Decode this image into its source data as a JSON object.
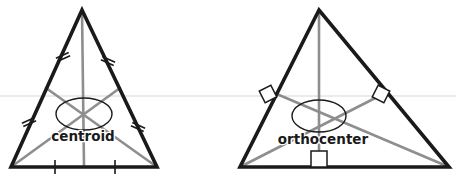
{
  "figure": {
    "background_color": "#ffffff",
    "width": 456,
    "height": 184,
    "artifact_line": {
      "name": "scan-artifact-line",
      "color": "#eceaea",
      "y": 96,
      "x1": 0,
      "x2": 456,
      "thickness": 2
    }
  },
  "styles": {
    "triangle_stroke": "#1a1a1a",
    "triangle_stroke_width": 3.6,
    "cevian_stroke": "#8e8e8e",
    "cevian_stroke_width": 2.6,
    "tick_stroke": "#1a1a1a",
    "tick_stroke_width": 1.6,
    "marker_square_stroke": "#1a1a1a",
    "marker_square_stroke_width": 1.5,
    "marker_square_fill": "#ffffff",
    "highlight_ellipse_stroke": "#1a1a1a",
    "highlight_ellipse_stroke_width": 1.4,
    "label_color": "#1a1a1a",
    "label_font_size": 13.5
  },
  "diagrams": [
    {
      "id": "centroid-diagram",
      "label": "centroid",
      "label_position": {
        "x": 83,
        "y": 137
      },
      "triangle": {
        "name": "isosceles-triangle",
        "vertices": [
          {
            "name": "apex",
            "x": 82,
            "y": 10
          },
          {
            "name": "bottom-left",
            "x": 11,
            "y": 167
          },
          {
            "name": "bottom-right",
            "x": 157,
            "y": 167
          }
        ]
      },
      "cevian_type": "median",
      "cevians": [
        {
          "name": "median-from-apex",
          "x1": 82,
          "y1": 10,
          "x2": 84,
          "y2": 167
        },
        {
          "name": "median-from-bottom-left",
          "x1": 11,
          "y1": 167,
          "x2": 120,
          "y2": 88
        },
        {
          "name": "median-from-bottom-right",
          "x1": 157,
          "y1": 167,
          "x2": 46,
          "y2": 88
        }
      ],
      "center_point": {
        "name": "centroid-point",
        "x": 84,
        "y": 115
      },
      "highlight_ellipse": {
        "cx": 84,
        "cy": 114,
        "rx": 28,
        "ry": 16
      },
      "congruence_ticks": [
        {
          "name": "tick-upper-left-side",
          "cx": 63,
          "cy": 57,
          "angle": 66,
          "count": 2
        },
        {
          "name": "tick-upper-right-side",
          "cx": 108,
          "cy": 61,
          "angle": 114,
          "count": 2
        },
        {
          "name": "tick-lower-left-side",
          "cx": 29,
          "cy": 122,
          "angle": 66,
          "count": 2
        },
        {
          "name": "tick-lower-right-side",
          "cx": 138,
          "cy": 127,
          "angle": 114,
          "count": 2
        },
        {
          "name": "tick-base-left",
          "cx": 55,
          "cy": 167,
          "angle": 0,
          "count": 1
        },
        {
          "name": "tick-base-right",
          "cx": 115,
          "cy": 167,
          "angle": 0,
          "count": 1
        }
      ],
      "right_angle_markers": []
    },
    {
      "id": "orthocenter-diagram",
      "label": "orthocenter",
      "label_position": {
        "x": 323,
        "y": 140
      },
      "triangle": {
        "name": "scalene-triangle",
        "vertices": [
          {
            "name": "apex",
            "x": 319,
            "y": 10
          },
          {
            "name": "bottom-left",
            "x": 240,
            "y": 167
          },
          {
            "name": "bottom-right",
            "x": 449,
            "y": 167
          }
        ]
      },
      "cevian_type": "altitude",
      "cevians": [
        {
          "name": "altitude-from-apex",
          "x1": 319,
          "y1": 10,
          "x2": 319,
          "y2": 167
        },
        {
          "name": "altitude-from-bottom-left",
          "x1": 240,
          "y1": 167,
          "x2": 387,
          "y2": 92
        },
        {
          "name": "altitude-from-bottom-right",
          "x1": 449,
          "y1": 167,
          "x2": 272,
          "y2": 92
        }
      ],
      "center_point": {
        "name": "orthocenter-point",
        "x": 319,
        "y": 117
      },
      "highlight_ellipse": {
        "cx": 319,
        "cy": 116,
        "rx": 27,
        "ry": 16
      },
      "congruence_ticks": [],
      "right_angle_markers": [
        {
          "name": "right-angle-left-side",
          "cx": 268,
          "cy": 94,
          "angle": 63,
          "size": 13
        },
        {
          "name": "right-angle-right-side",
          "cx": 381,
          "cy": 94,
          "angle": -63,
          "size": 13
        },
        {
          "name": "right-angle-base",
          "cx": 319,
          "cy": 159,
          "angle": 0,
          "size": 16
        }
      ]
    }
  ]
}
